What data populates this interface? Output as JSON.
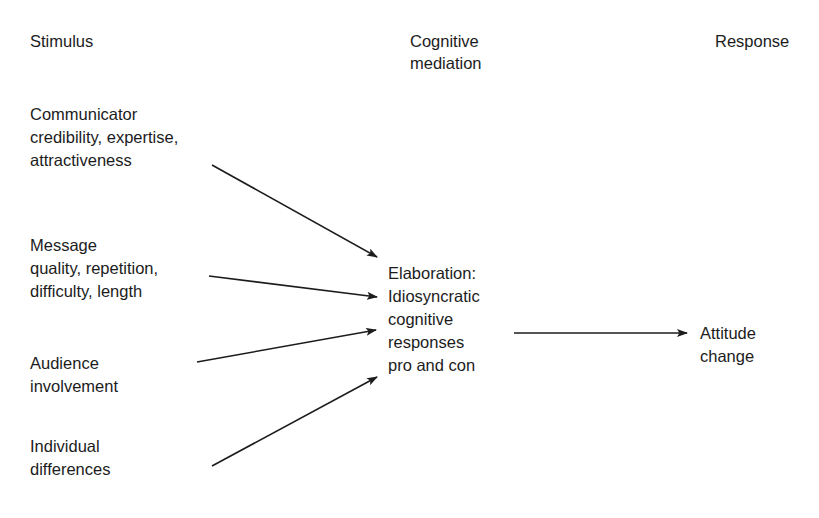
{
  "diagram": {
    "background_color": "#ffffff",
    "text_color": "#1c1c1c",
    "arrow_color": "#1c1c1c",
    "columns": [
      {
        "id": "stimulus",
        "label": "Stimulus"
      },
      {
        "id": "cognitive",
        "label": "Cognitive\nmediation"
      },
      {
        "id": "response",
        "label": "Response"
      }
    ],
    "nodes": {
      "communicator": "Communicator\ncredibility, expertise,\nattractiveness",
      "message": "Message\nquality, repetition,\ndifficulty, length",
      "audience": "Audience\ninvolvement",
      "individual": "Individual\ndifferences",
      "elaboration": "Elaboration:\nIdiosyncratic\ncognitive\nresponses\npro and con",
      "attitude": "Attitude\nchange"
    },
    "edges": [
      {
        "id": "communicator-to-elaboration",
        "from": "communicator",
        "to": "elaboration",
        "label": ""
      },
      {
        "id": "message-to-elaboration",
        "from": "message",
        "to": "elaboration",
        "label": ""
      },
      {
        "id": "audience-to-elaboration",
        "from": "audience",
        "to": "elaboration",
        "label": ""
      },
      {
        "id": "individual-to-elaboration",
        "from": "individual",
        "to": "elaboration",
        "label": ""
      },
      {
        "id": "elaboration-to-attitude",
        "from": "elaboration",
        "to": "attitude",
        "label": ""
      }
    ]
  }
}
